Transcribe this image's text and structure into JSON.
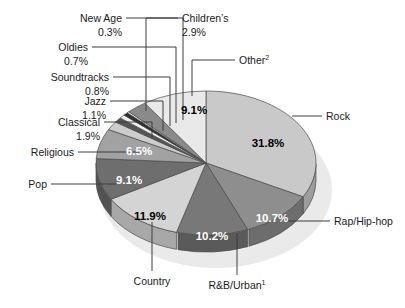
{
  "chart_data": {
    "type": "pie",
    "title": "",
    "subtitle": "",
    "xlabel": "",
    "ylabel": "",
    "legend_position": "none",
    "grid": false,
    "units": "percent",
    "categories": [
      "Rock",
      "Rap/Hip-hop",
      "R&B/Urban",
      "Country",
      "Pop",
      "Religious",
      "Classical",
      "Jazz",
      "Soundtracks",
      "Oldies",
      "New Age",
      "Children's",
      "Other"
    ],
    "values": [
      31.8,
      10.7,
      10.2,
      11.9,
      9.1,
      6.5,
      1.9,
      1.1,
      0.8,
      0.7,
      0.3,
      2.9,
      9.1
    ],
    "slices": [
      {
        "name": "Rock",
        "label": "Rock",
        "value": 31.8,
        "value_text": "31.8%",
        "color": "#c9c9c9",
        "side_color": "#9d9d9d",
        "label_inside": true,
        "label_fill": "dark"
      },
      {
        "name": "Rap/Hip-hop",
        "label": "Rap/Hip-hop",
        "value": 10.7,
        "value_text": "10.7%",
        "color": "#8e8e8e",
        "side_color": "#6d6d6d",
        "label_inside": true,
        "label_fill": "light"
      },
      {
        "name": "R&B/Urban",
        "label": "R&B/Urban",
        "value": 10.2,
        "value_text": "10.2%",
        "color": "#787878",
        "side_color": "#5a5a5a",
        "label_inside": true,
        "label_fill": "light",
        "footnote": "1"
      },
      {
        "name": "Country",
        "label": "Country",
        "value": 11.9,
        "value_text": "11.9%",
        "color": "#d4d4d4",
        "side_color": "#a8a8a8",
        "label_inside": true,
        "label_fill": "dark"
      },
      {
        "name": "Pop",
        "label": "Pop",
        "value": 9.1,
        "value_text": "9.1%",
        "color": "#6e6e6e",
        "side_color": "#525252",
        "label_inside": true,
        "label_fill": "light"
      },
      {
        "name": "Religious",
        "label": "Religious",
        "value": 6.5,
        "value_text": "6.5%",
        "color": "#a2a2a2",
        "side_color": "#7d7d7d",
        "label_inside": true,
        "label_fill": "light"
      },
      {
        "name": "Classical",
        "label": "Classical",
        "value": 1.9,
        "value_text": "1.9%",
        "color": "#cccccc",
        "side_color": "#a0a0a0",
        "label_inside": false,
        "label_fill": "dark"
      },
      {
        "name": "Jazz",
        "label": "Jazz",
        "value": 1.1,
        "value_text": "1.1%",
        "color": "#555555",
        "side_color": "#3d3d3d",
        "label_inside": false,
        "label_fill": "dark"
      },
      {
        "name": "Soundtracks",
        "label": "Soundtracks",
        "value": 0.8,
        "value_text": "0.8%",
        "color": "#f2f2f2",
        "side_color": "#c2c2c2",
        "label_inside": false,
        "label_fill": "dark"
      },
      {
        "name": "Oldies",
        "label": "Oldies",
        "value": 0.7,
        "value_text": "0.7%",
        "color": "#2e2e2e",
        "side_color": "#1f1f1f",
        "label_inside": false,
        "label_fill": "dark"
      },
      {
        "name": "New Age",
        "label": "New Age",
        "value": 0.3,
        "value_text": "0.3%",
        "color": "#ffffff",
        "side_color": "#cfcfcf",
        "label_inside": false,
        "label_fill": "dark"
      },
      {
        "name": "Children's",
        "label": "Children’s",
        "value": 2.9,
        "value_text": "2.9%",
        "color": "#8a8a8a",
        "side_color": "#676767",
        "label_inside": false,
        "label_fill": "dark"
      },
      {
        "name": "Other",
        "label": "Other",
        "value": 9.1,
        "value_text": "9.1%",
        "color": "#e9e9e9",
        "side_color": "#bdbdbd",
        "label_inside": true,
        "label_fill": "dark",
        "footnote": "2"
      }
    ]
  },
  "callouts": {
    "new_age": {
      "name": "New Age",
      "pct": "0.3%"
    },
    "oldies": {
      "name": "Oldies",
      "pct": "0.7%"
    },
    "soundtracks": {
      "name": "Soundtracks",
      "pct": "0.8%"
    },
    "jazz": {
      "name": "Jazz",
      "pct": "1.1%"
    },
    "classical": {
      "name": "Classical",
      "pct": "1.9%"
    },
    "religious": {
      "name": "Religious",
      "pct": ""
    },
    "pop": {
      "name": "Pop",
      "pct": ""
    },
    "country": {
      "name": "Country",
      "pct": ""
    },
    "rnb": {
      "name": "R&B/Urban",
      "sup": "1"
    },
    "rap": {
      "name": "Rap/Hip-hop",
      "pct": ""
    },
    "rock": {
      "name": "Rock",
      "pct": ""
    },
    "children": {
      "name": "Children’s",
      "pct": "2.9%"
    },
    "other": {
      "name": "Other",
      "sup": "2"
    }
  },
  "inside_values": {
    "other": "9.1%",
    "rock": "31.8%",
    "rap": "10.7%",
    "rnb": "10.2%",
    "country": "11.9%",
    "pop": "9.1%",
    "religious": "6.5%"
  },
  "colors": {
    "text": "#1a1a1a",
    "leader": "#3c3c3c",
    "shadow": "#e3e3e3",
    "background": "#ffffff"
  }
}
